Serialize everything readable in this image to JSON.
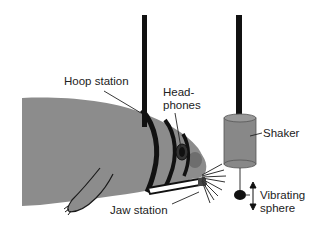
{
  "diagram": {
    "labels": {
      "hoop_station": "Hoop station",
      "headphones_line1": "Head-",
      "headphones_line2": "phones",
      "shaker": "Shaker",
      "jaw_station": "Jaw station",
      "vibrating_sphere_line1": "Vibrating",
      "vibrating_sphere_line2": "sphere"
    },
    "colors": {
      "seal_body": "#8c8c8c",
      "outline": "#1a1a1a",
      "pole": "#111111",
      "shaker": "#888888",
      "sphere": "#111111",
      "background": "#ffffff"
    },
    "icons": {
      "vibration_arrow": "double-headed-vertical-arrow"
    }
  }
}
